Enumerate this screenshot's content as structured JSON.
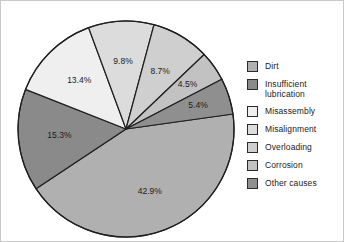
{
  "chart_data": {
    "type": "pie",
    "title": "",
    "subtitle": "",
    "xlabel": "",
    "ylabel": "",
    "legend_position": "right",
    "grid": false,
    "categories": [
      "Dirt",
      "Insufficient lubrication",
      "Misassembly",
      "Misalignment",
      "Overloading",
      "Corrosion",
      "Other causes"
    ],
    "values": [
      42.9,
      15.3,
      13.4,
      9.8,
      8.7,
      4.5,
      5.4
    ],
    "value_labels": [
      "42.9%",
      "15.3%",
      "13.4%",
      "9.8%",
      "8.7%",
      "4.5%",
      "5.4%"
    ],
    "units": "percent",
    "slice_colors": [
      "#b0b0b0",
      "#8a8a8a",
      "#efefef",
      "#dcdcdc",
      "#cfcfcf",
      "#c2c2c2",
      "#8f8f8f"
    ],
    "slices": [
      {
        "label": "Dirt",
        "value": 42.9,
        "value_label": "42.9%",
        "color": "#b0b0b0"
      },
      {
        "label": "Insufficient lubrication",
        "value": 15.3,
        "value_label": "15.3%",
        "color": "#8a8a8a"
      },
      {
        "label": "Misassembly",
        "value": 13.4,
        "value_label": "13.4%",
        "color": "#efefef"
      },
      {
        "label": "Misalignment",
        "value": 9.8,
        "value_label": "9.8%",
        "color": "#dcdcdc"
      },
      {
        "label": "Overloading",
        "value": 8.7,
        "value_label": "8.7%",
        "color": "#cfcfcf"
      },
      {
        "label": "Corrosion",
        "value": 4.5,
        "value_label": "4.5%",
        "color": "#c2c2c2"
      },
      {
        "label": "Other causes",
        "value": 5.4,
        "value_label": "5.4%",
        "color": "#8f8f8f"
      }
    ]
  },
  "legend": {
    "items": [
      {
        "label": "Dirt",
        "color": "#b0b0b0"
      },
      {
        "label": "Insufficient\nlubrication",
        "color": "#8a8a8a"
      },
      {
        "label": "Misassembly",
        "color": "#efefef"
      },
      {
        "label": "Misalignment",
        "color": "#dcdcdc"
      },
      {
        "label": "Overloading",
        "color": "#cfcfcf"
      },
      {
        "label": "Corrosion",
        "color": "#c2c2c2"
      },
      {
        "label": "Other causes",
        "color": "#8f8f8f"
      }
    ]
  },
  "pie_geometry": {
    "cx": 125,
    "cy": 128,
    "r": 108,
    "start_angle_deg": -8,
    "direction": "clockwise",
    "stroke": "#1f1f1f",
    "stroke_width": 1.2,
    "label_radius_factor": 0.62
  }
}
